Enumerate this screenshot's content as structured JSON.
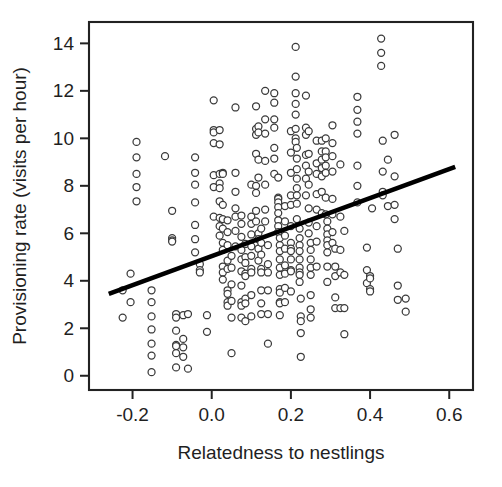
{
  "chart_data": {
    "type": "scatter",
    "title": "",
    "subtitle": "",
    "xlabel": "Relatedness to nestlings",
    "ylabel": "Provisioning rate (visits per hour)",
    "xlim": [
      -0.31,
      0.66
    ],
    "ylim": [
      -0.6,
      14.9
    ],
    "xticks": [
      -0.2,
      0.0,
      0.2,
      0.4,
      0.6
    ],
    "xticklabels": [
      "-0.2",
      "0.0",
      "0.2",
      "0.4",
      "0.6"
    ],
    "yticks": [
      0,
      2,
      4,
      6,
      8,
      10,
      12,
      14
    ],
    "yticklabels": [
      "0",
      "2",
      "4",
      "6",
      "8",
      "10",
      "12",
      "14"
    ],
    "grid": false,
    "legend": null,
    "marker": {
      "shape": "open-circle",
      "radius_px": 3.5,
      "fill": "#ffffff",
      "stroke": "#3a3a3a"
    },
    "trendline": {
      "type": "linear-fit",
      "color": "#000000",
      "x_start": -0.26,
      "y_start": 3.45,
      "x_end": 0.615,
      "y_end": 8.8,
      "slope": 6.11,
      "intercept": 5.04
    },
    "n_points": 318,
    "points": [
      [
        -0.225,
        3.6
      ],
      [
        -0.225,
        2.45
      ],
      [
        -0.205,
        4.3
      ],
      [
        -0.205,
        3.1
      ],
      [
        -0.19,
        9.85
      ],
      [
        -0.19,
        9.2
      ],
      [
        -0.19,
        8.5
      ],
      [
        -0.19,
        7.95
      ],
      [
        -0.19,
        7.35
      ],
      [
        -0.152,
        3.6
      ],
      [
        -0.152,
        3.1
      ],
      [
        -0.152,
        2.5
      ],
      [
        -0.152,
        1.95
      ],
      [
        -0.152,
        1.35
      ],
      [
        -0.152,
        0.85
      ],
      [
        -0.152,
        0.15
      ],
      [
        -0.118,
        9.25
      ],
      [
        -0.1,
        6.95
      ],
      [
        -0.1,
        5.8
      ],
      [
        -0.1,
        5.7
      ],
      [
        -0.1,
        5.65
      ],
      [
        -0.09,
        2.6
      ],
      [
        -0.09,
        2.45
      ],
      [
        -0.09,
        1.9
      ],
      [
        -0.09,
        1.3
      ],
      [
        -0.09,
        1.25
      ],
      [
        -0.09,
        0.95
      ],
      [
        -0.09,
        0.35
      ],
      [
        -0.072,
        2.55
      ],
      [
        -0.072,
        1.55
      ],
      [
        -0.072,
        1.2
      ],
      [
        -0.072,
        0.8
      ],
      [
        -0.06,
        2.6
      ],
      [
        -0.06,
        0.3
      ],
      [
        -0.042,
        9.2
      ],
      [
        -0.042,
        8.55
      ],
      [
        -0.042,
        8.05
      ],
      [
        -0.042,
        7.3
      ],
      [
        -0.042,
        6.35
      ],
      [
        -0.042,
        5.75
      ],
      [
        -0.042,
        5.2
      ],
      [
        -0.03,
        4.7
      ],
      [
        -0.03,
        4.45
      ],
      [
        -0.03,
        4.35
      ],
      [
        -0.012,
        2.55
      ],
      [
        -0.012,
        1.85
      ],
      [
        0.005,
        11.6
      ],
      [
        0.005,
        10.35
      ],
      [
        0.005,
        10.25
      ],
      [
        0.005,
        9.8
      ],
      [
        0.005,
        8.45
      ],
      [
        0.005,
        7.95
      ],
      [
        0.005,
        6.7
      ],
      [
        0.02,
        10.35
      ],
      [
        0.02,
        9.75
      ],
      [
        0.02,
        8.5
      ],
      [
        0.02,
        8.1
      ],
      [
        0.02,
        7.9
      ],
      [
        0.02,
        7.35
      ],
      [
        0.02,
        6.65
      ],
      [
        0.02,
        6.3
      ],
      [
        0.02,
        5.9
      ],
      [
        0.028,
        8.55
      ],
      [
        0.028,
        8.5
      ],
      [
        0.028,
        7.2
      ],
      [
        0.028,
        6.6
      ],
      [
        0.028,
        6.2
      ],
      [
        0.028,
        5.6
      ],
      [
        0.028,
        5.3
      ],
      [
        0.028,
        4.6
      ],
      [
        0.028,
        4.35
      ],
      [
        0.028,
        4.05
      ],
      [
        0.04,
        6.55
      ],
      [
        0.04,
        6.05
      ],
      [
        0.04,
        5.5
      ],
      [
        0.04,
        4.85
      ],
      [
        0.04,
        4.5
      ],
      [
        0.04,
        3.6
      ],
      [
        0.04,
        3.45
      ],
      [
        0.04,
        3.1
      ],
      [
        0.04,
        2.95
      ],
      [
        0.05,
        5.05
      ],
      [
        0.05,
        4.55
      ],
      [
        0.05,
        3.85
      ],
      [
        0.05,
        3.15
      ],
      [
        0.05,
        2.45
      ],
      [
        0.05,
        0.95
      ],
      [
        0.06,
        11.3
      ],
      [
        0.06,
        8.55
      ],
      [
        0.06,
        7.75
      ],
      [
        0.06,
        7.05
      ],
      [
        0.06,
        6.7
      ],
      [
        0.06,
        6.1
      ],
      [
        0.06,
        5.45
      ],
      [
        0.075,
        6.75
      ],
      [
        0.075,
        6.4
      ],
      [
        0.075,
        5.85
      ],
      [
        0.075,
        5.3
      ],
      [
        0.075,
        4.9
      ],
      [
        0.075,
        4.4
      ],
      [
        0.075,
        3.8
      ],
      [
        0.075,
        3.1
      ],
      [
        0.075,
        2.95
      ],
      [
        0.075,
        2.45
      ],
      [
        0.085,
        5.55
      ],
      [
        0.085,
        5.0
      ],
      [
        0.085,
        4.75
      ],
      [
        0.085,
        4.3
      ],
      [
        0.085,
        4.2
      ],
      [
        0.085,
        3.25
      ],
      [
        0.085,
        3.05
      ],
      [
        0.085,
        2.3
      ],
      [
        0.1,
        8.05
      ],
      [
        0.1,
        6.7
      ],
      [
        0.1,
        6.4
      ],
      [
        0.1,
        5.95
      ],
      [
        0.1,
        5.45
      ],
      [
        0.1,
        5.05
      ],
      [
        0.1,
        4.5
      ],
      [
        0.1,
        4.35
      ],
      [
        0.1,
        3.4
      ],
      [
        0.1,
        2.5
      ],
      [
        0.112,
        11.35
      ],
      [
        0.112,
        10.4
      ],
      [
        0.112,
        10.15
      ],
      [
        0.112,
        9.35
      ],
      [
        0.112,
        8.0
      ],
      [
        0.112,
        7.7
      ],
      [
        0.112,
        6.95
      ],
      [
        0.112,
        6.5
      ],
      [
        0.118,
        10.5
      ],
      [
        0.118,
        10.25
      ],
      [
        0.118,
        9.1
      ],
      [
        0.118,
        8.35
      ],
      [
        0.118,
        6.0
      ],
      [
        0.118,
        5.75
      ],
      [
        0.118,
        5.35
      ],
      [
        0.118,
        4.85
      ],
      [
        0.125,
        6.2
      ],
      [
        0.125,
        5.6
      ],
      [
        0.125,
        5.1
      ],
      [
        0.125,
        4.5
      ],
      [
        0.125,
        4.35
      ],
      [
        0.125,
        3.6
      ],
      [
        0.125,
        3.05
      ],
      [
        0.125,
        2.6
      ],
      [
        0.135,
        12.0
      ],
      [
        0.135,
        10.8
      ],
      [
        0.135,
        10.2
      ],
      [
        0.135,
        9.05
      ],
      [
        0.135,
        8.05
      ],
      [
        0.135,
        7.0
      ],
      [
        0.135,
        6.5
      ],
      [
        0.142,
        5.5
      ],
      [
        0.142,
        4.7
      ],
      [
        0.142,
        4.35
      ],
      [
        0.142,
        3.6
      ],
      [
        0.142,
        2.6
      ],
      [
        0.142,
        1.35
      ],
      [
        0.158,
        11.9
      ],
      [
        0.158,
        11.5
      ],
      [
        0.158,
        10.8
      ],
      [
        0.158,
        10.45
      ],
      [
        0.158,
        9.6
      ],
      [
        0.158,
        9.15
      ],
      [
        0.158,
        8.5
      ],
      [
        0.168,
        8.35
      ],
      [
        0.168,
        7.5
      ],
      [
        0.168,
        7.45
      ],
      [
        0.168,
        7.3
      ],
      [
        0.168,
        7.1
      ],
      [
        0.168,
        6.85
      ],
      [
        0.168,
        6.55
      ],
      [
        0.168,
        6.3
      ],
      [
        0.168,
        6.05
      ],
      [
        0.172,
        5.8
      ],
      [
        0.172,
        5.5
      ],
      [
        0.172,
        5.25
      ],
      [
        0.172,
        4.9
      ],
      [
        0.172,
        4.55
      ],
      [
        0.172,
        4.25
      ],
      [
        0.172,
        3.65
      ],
      [
        0.172,
        3.5
      ],
      [
        0.172,
        3.1
      ],
      [
        0.172,
        3.05
      ],
      [
        0.172,
        2.55
      ],
      [
        0.185,
        7.15
      ],
      [
        0.185,
        6.5
      ],
      [
        0.185,
        5.9
      ],
      [
        0.185,
        5.35
      ],
      [
        0.185,
        4.65
      ],
      [
        0.185,
        4.3
      ],
      [
        0.185,
        3.7
      ],
      [
        0.185,
        3.1
      ],
      [
        0.2,
        10.3
      ],
      [
        0.2,
        9.4
      ],
      [
        0.2,
        8.55
      ],
      [
        0.2,
        7.6
      ],
      [
        0.2,
        7.2
      ],
      [
        0.2,
        6.3
      ],
      [
        0.2,
        5.6
      ],
      [
        0.2,
        5.35
      ],
      [
        0.2,
        5.25
      ],
      [
        0.2,
        4.9
      ],
      [
        0.2,
        4.45
      ],
      [
        0.2,
        4.4
      ],
      [
        0.2,
        3.55
      ],
      [
        0.212,
        13.85
      ],
      [
        0.212,
        12.6
      ],
      [
        0.212,
        11.9
      ],
      [
        0.212,
        11.45
      ],
      [
        0.212,
        11.0
      ],
      [
        0.212,
        10.4
      ],
      [
        0.212,
        10.0
      ],
      [
        0.212,
        9.85
      ],
      [
        0.215,
        9.6
      ],
      [
        0.215,
        9.15
      ],
      [
        0.215,
        8.7
      ],
      [
        0.215,
        8.3
      ],
      [
        0.215,
        7.9
      ],
      [
        0.215,
        7.6
      ],
      [
        0.215,
        7.25
      ],
      [
        0.215,
        6.6
      ],
      [
        0.222,
        6.2
      ],
      [
        0.222,
        5.8
      ],
      [
        0.222,
        5.5
      ],
      [
        0.222,
        5.25
      ],
      [
        0.222,
        4.9
      ],
      [
        0.222,
        4.55
      ],
      [
        0.222,
        4.35
      ],
      [
        0.222,
        4.25
      ],
      [
        0.222,
        3.95
      ],
      [
        0.225,
        3.25
      ],
      [
        0.225,
        2.5
      ],
      [
        0.225,
        2.3
      ],
      [
        0.225,
        1.8
      ],
      [
        0.225,
        0.8
      ],
      [
        0.238,
        11.8
      ],
      [
        0.238,
        10.45
      ],
      [
        0.238,
        10.15
      ],
      [
        0.238,
        9.3
      ],
      [
        0.238,
        8.85
      ],
      [
        0.238,
        8.3
      ],
      [
        0.238,
        7.6
      ],
      [
        0.245,
        10.3
      ],
      [
        0.245,
        9.35
      ],
      [
        0.245,
        8.6
      ],
      [
        0.245,
        8.05
      ],
      [
        0.245,
        7.05
      ],
      [
        0.245,
        6.45
      ],
      [
        0.245,
        6.0
      ],
      [
        0.25,
        5.6
      ],
      [
        0.25,
        5.3
      ],
      [
        0.25,
        4.9
      ],
      [
        0.25,
        4.55
      ],
      [
        0.25,
        4.25
      ],
      [
        0.25,
        3.4
      ],
      [
        0.25,
        2.8
      ],
      [
        0.25,
        2.45
      ],
      [
        0.265,
        9.9
      ],
      [
        0.265,
        8.95
      ],
      [
        0.265,
        8.5
      ],
      [
        0.265,
        7.65
      ],
      [
        0.265,
        7.0
      ],
      [
        0.265,
        6.3
      ],
      [
        0.265,
        5.65
      ],
      [
        0.265,
        4.6
      ],
      [
        0.278,
        9.9
      ],
      [
        0.278,
        9.45
      ],
      [
        0.278,
        9.1
      ],
      [
        0.278,
        8.75
      ],
      [
        0.278,
        8.4
      ],
      [
        0.278,
        7.75
      ],
      [
        0.278,
        6.85
      ],
      [
        0.288,
        10.0
      ],
      [
        0.288,
        9.45
      ],
      [
        0.288,
        9.2
      ],
      [
        0.288,
        8.85
      ],
      [
        0.288,
        8.55
      ],
      [
        0.288,
        7.5
      ],
      [
        0.288,
        6.8
      ],
      [
        0.292,
        6.5
      ],
      [
        0.292,
        6.2
      ],
      [
        0.292,
        5.95
      ],
      [
        0.292,
        5.7
      ],
      [
        0.292,
        5.5
      ],
      [
        0.292,
        5.2
      ],
      [
        0.292,
        4.6
      ],
      [
        0.292,
        3.95
      ],
      [
        0.305,
        10.55
      ],
      [
        0.305,
        9.8
      ],
      [
        0.305,
        9.25
      ],
      [
        0.305,
        8.6
      ],
      [
        0.305,
        7.45
      ],
      [
        0.305,
        6.8
      ],
      [
        0.305,
        6.05
      ],
      [
        0.305,
        5.6
      ],
      [
        0.312,
        5.35
      ],
      [
        0.312,
        4.6
      ],
      [
        0.312,
        4.2
      ],
      [
        0.312,
        3.3
      ],
      [
        0.312,
        2.85
      ],
      [
        0.325,
        8.9
      ],
      [
        0.325,
        6.7
      ],
      [
        0.325,
        5.3
      ],
      [
        0.325,
        4.35
      ],
      [
        0.325,
        2.85
      ],
      [
        0.335,
        6.1
      ],
      [
        0.335,
        4.25
      ],
      [
        0.335,
        2.85
      ],
      [
        0.335,
        1.75
      ],
      [
        0.368,
        11.75
      ],
      [
        0.368,
        11.2
      ],
      [
        0.368,
        10.7
      ],
      [
        0.368,
        10.2
      ],
      [
        0.368,
        8.85
      ],
      [
        0.368,
        8.0
      ],
      [
        0.368,
        7.3
      ],
      [
        0.392,
        5.4
      ],
      [
        0.392,
        4.45
      ],
      [
        0.392,
        3.9
      ],
      [
        0.4,
        4.2
      ],
      [
        0.4,
        4.1
      ],
      [
        0.4,
        3.65
      ],
      [
        0.4,
        3.55
      ],
      [
        0.405,
        7.05
      ],
      [
        0.428,
        14.2
      ],
      [
        0.428,
        13.6
      ],
      [
        0.428,
        13.05
      ],
      [
        0.432,
        9.9
      ],
      [
        0.432,
        8.6
      ],
      [
        0.432,
        7.75
      ],
      [
        0.432,
        7.6
      ],
      [
        0.445,
        9.1
      ],
      [
        0.445,
        7.15
      ],
      [
        0.462,
        10.15
      ],
      [
        0.462,
        8.4
      ],
      [
        0.462,
        7.2
      ],
      [
        0.462,
        6.6
      ],
      [
        0.47,
        5.35
      ],
      [
        0.47,
        3.8
      ],
      [
        0.47,
        3.2
      ],
      [
        0.49,
        3.25
      ],
      [
        0.49,
        2.7
      ]
    ]
  },
  "figure": {
    "background": "#ffffff",
    "frame_color": "#222222",
    "marker_stroke": "#3a3a3a",
    "line_color": "#000000"
  }
}
